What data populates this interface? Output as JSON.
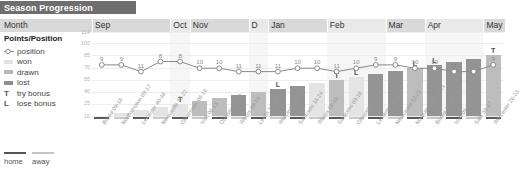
{
  "title": "Season Progression",
  "header": {
    "month_label": "Month"
  },
  "legend": {
    "heading": "Points/Position",
    "items": [
      {
        "glyph": "position-marker",
        "label": "position"
      },
      {
        "glyph": "swatch-won",
        "label": "won"
      },
      {
        "glyph": "swatch-drawn",
        "label": "drawn"
      },
      {
        "glyph": "swatch-lost",
        "label": "lost"
      },
      {
        "glyph": "T",
        "label": "try bonus"
      },
      {
        "glyph": "L",
        "label": "lose bonus"
      }
    ],
    "home_away": {
      "home": "home",
      "away": "away"
    }
  },
  "colors": {
    "title_bar": "#6e6e6e",
    "month_band": "#d9d9d9",
    "won": "#e4e4e4",
    "drawn": "#bdbdbd",
    "lost": "#949494",
    "line": "#8a8a8a",
    "home": "#5a5a5a",
    "away": "#c9c9c9"
  },
  "chart_data": {
    "type": "line",
    "title": "Season Progression",
    "xlabel": "",
    "ylabel": "Points/Position",
    "ylim": [
      10,
      114
    ],
    "yticks": [
      114,
      100,
      85,
      70,
      55,
      40,
      25,
      10
    ],
    "grid": true,
    "legend_position": "left",
    "months": [
      {
        "label": "Sep",
        "start": 0,
        "span": 4
      },
      {
        "label": "Oct",
        "start": 4,
        "span": 1
      },
      {
        "label": "Nov",
        "start": 5,
        "span": 3
      },
      {
        "label": "D",
        "start": 8,
        "span": 1
      },
      {
        "label": "Jan",
        "start": 9,
        "span": 3
      },
      {
        "label": "Feb",
        "start": 12,
        "span": 3
      },
      {
        "label": "Mar",
        "start": 15,
        "span": 2
      },
      {
        "label": "Apr",
        "start": 17,
        "span": 3
      },
      {
        "label": "May",
        "start": 20,
        "span": 2
      }
    ],
    "categories": [
      "Bristol 09-18",
      "Northampton 09-17",
      "Leicester 40-36",
      "Newcastle 18-22",
      "Gloucester 08-16",
      "Irish 06-13",
      "Quinsey 12-19",
      "Wasps 09-19",
      "Leeds 12-16",
      "Worcester 16-36",
      "Saracens 16-24",
      "Wasps 08-16",
      "Saracens 09-18",
      "Gloucester 30-18",
      "Leicester 12-19",
      "Newcastle 12-22",
      "Northampton 24-21",
      "Bristol 31-16",
      "Irish 09-12",
      "Sale 38-37",
      "Worcester 26-23"
    ],
    "series": [
      {
        "name": "position",
        "values": [
          9,
          9,
          11,
          8,
          8,
          10,
          10,
          11,
          11,
          11,
          10,
          10,
          11,
          10,
          9,
          9,
          10,
          10,
          11,
          11,
          9
        ]
      }
    ],
    "bars": [
      {
        "result": "won",
        "points": 0
      },
      {
        "result": "won",
        "points": 4
      },
      {
        "result": "won",
        "points": 9
      },
      {
        "result": "won",
        "points": 13
      },
      {
        "result": "won",
        "points": 17
      },
      {
        "result": "drawn",
        "points": 22
      },
      {
        "result": "drawn",
        "points": 26
      },
      {
        "result": "lost",
        "points": 31
      },
      {
        "result": "drawn",
        "points": 35
      },
      {
        "result": "lost",
        "points": 40
      },
      {
        "result": "lost",
        "points": 44
      },
      {
        "result": "won",
        "points": 49
      },
      {
        "result": "drawn",
        "points": 53
      },
      {
        "result": "won",
        "points": 57
      },
      {
        "result": "lost",
        "points": 62
      },
      {
        "result": "lost",
        "points": 66
      },
      {
        "result": "drawn",
        "points": 71
      },
      {
        "result": "lost",
        "points": 75
      },
      {
        "result": "lost",
        "points": 80
      },
      {
        "result": "lost",
        "points": 84
      },
      {
        "result": "drawn",
        "points": 90
      }
    ],
    "venues": [
      "home",
      "away",
      "home",
      "away",
      "home",
      "away",
      "home",
      "away",
      "home",
      "away",
      "home",
      "away",
      "home",
      "away",
      "home",
      "away",
      "home",
      "away",
      "home",
      "away",
      "home"
    ],
    "bonus_marks": [
      {
        "index": 4,
        "mark": "T"
      },
      {
        "index": 9,
        "mark": "L"
      },
      {
        "index": 12,
        "mark": "T"
      },
      {
        "index": 13,
        "mark": "L"
      },
      {
        "index": 16,
        "mark": "L"
      },
      {
        "index": 17,
        "mark": "L"
      },
      {
        "index": 20,
        "mark": "T"
      }
    ]
  }
}
